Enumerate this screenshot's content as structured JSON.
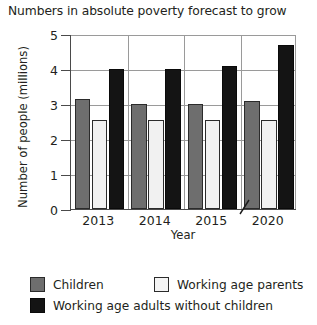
{
  "chart_data": {
    "type": "bar",
    "title": "Numbers in absolute poverty forecast to grow",
    "xlabel": "Year",
    "ylabel": "Number of people (millions)",
    "categories": [
      "2013",
      "2014",
      "2015",
      "2020"
    ],
    "series": [
      {
        "name": "Children",
        "color": "#6e6e6e",
        "values": [
          3.15,
          3.0,
          3.0,
          3.1
        ]
      },
      {
        "name": "Working age parents",
        "color": "#f1f1f1",
        "values": [
          2.55,
          2.55,
          2.55,
          2.55
        ]
      },
      {
        "name": "Working age adults without children",
        "color": "#141414",
        "values": [
          4.0,
          4.0,
          4.1,
          4.7
        ]
      }
    ],
    "ylim": [
      0,
      5
    ],
    "yticks": [
      "0",
      "1",
      "2",
      "3",
      "4",
      "5"
    ],
    "grid": true,
    "legend_position": "bottom",
    "axis_break": {
      "present": true,
      "between": [
        "2015",
        "2020"
      ],
      "icon": "axis-break-slash"
    }
  }
}
